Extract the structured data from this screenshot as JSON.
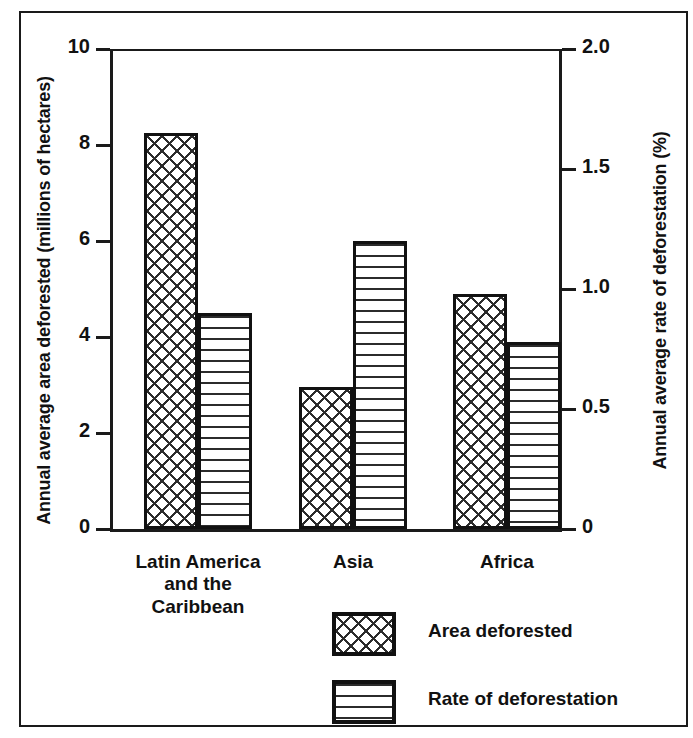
{
  "chart_data": {
    "type": "bar",
    "title": "",
    "subtitle": "",
    "categories": [
      "Latin America and the Caribbean",
      "Asia",
      "Africa"
    ],
    "series": [
      {
        "name": "Area deforested",
        "axis": "left",
        "unit": "millions of hectares",
        "values": [
          8.25,
          2.95,
          4.9
        ],
        "pattern": "cross-hatch"
      },
      {
        "name": "Rate of deforestation",
        "axis": "right",
        "unit": "%",
        "values": [
          0.9,
          1.2,
          0.78
        ],
        "pattern": "horizontal-lines"
      }
    ],
    "xlabel": "",
    "ylabel": "Annual average area deforested (millions of hectares)",
    "y2label": "Annual average rate of deforestation (%)",
    "ylim": [
      0,
      10
    ],
    "y2lim": [
      0,
      2.0
    ],
    "yticks": [
      "0",
      "2",
      "4",
      "6",
      "8",
      "10"
    ],
    "ytick_values": [
      0,
      2,
      4,
      6,
      8,
      10
    ],
    "y2ticks": [
      "0",
      "0.5",
      "1.0",
      "1.5",
      "2.0"
    ],
    "y2tick_values": [
      0,
      0.5,
      1.0,
      1.5,
      2.0
    ],
    "grid": false,
    "legend_position": "bottom-center",
    "legend": [
      "Area deforested",
      "Rate of deforestation"
    ]
  },
  "axes": {
    "left_title": "Annual average area deforested (millions of hectares)",
    "right_title": "Annual average rate of deforestation (%)"
  },
  "category_labels": [
    {
      "lines": [
        "Latin America",
        "and the",
        "Caribbean"
      ]
    },
    {
      "lines": [
        "Asia"
      ]
    },
    {
      "lines": [
        "Africa"
      ]
    }
  ],
  "legend": {
    "items": [
      {
        "label": "Area deforested",
        "swatch": "cross-hatch-swatch"
      },
      {
        "label": "Rate of deforestation",
        "swatch": "horizontal-lines-swatch"
      }
    ]
  },
  "colors": {
    "ink": "#111111",
    "hatch": "#2b2b2b",
    "background": "#ffffff"
  }
}
